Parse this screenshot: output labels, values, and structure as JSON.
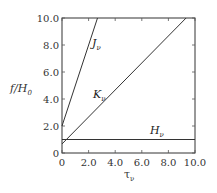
{
  "chart_data": {
    "type": "line",
    "title": "",
    "xlabel": "τ_ν",
    "ylabel": "f/H_0",
    "xlim": [
      0,
      10.0
    ],
    "ylim": [
      0,
      10.0
    ],
    "grid": false,
    "legend": "inline labels",
    "x_ticks": [
      "0",
      "2.0",
      "4.0",
      "6.0",
      "8.0",
      "10.0"
    ],
    "y_ticks": [
      "0",
      "2.0",
      "4.0",
      "6.0",
      "8.0",
      "10.0"
    ],
    "series": [
      {
        "name": "J_ν",
        "label_main": "J",
        "label_sub": "ν",
        "x": [
          0,
          2.67
        ],
        "y": [
          2.0,
          10.0
        ]
      },
      {
        "name": "K_ν",
        "label_main": "K",
        "label_sub": "ν",
        "x": [
          0,
          9.33
        ],
        "y": [
          0.67,
          10.0
        ]
      },
      {
        "name": "H_ν",
        "label_main": "H",
        "label_sub": "ν",
        "x": [
          0,
          10.0
        ],
        "y": [
          1.0,
          1.0
        ]
      }
    ]
  },
  "labels": {
    "ylabel_main": "f/H",
    "ylabel_sub": "0",
    "xlabel_main": "τ",
    "xlabel_sub": "ν"
  }
}
